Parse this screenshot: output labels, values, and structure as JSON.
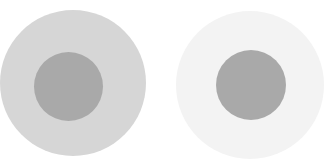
{
  "figure": {
    "left": {
      "outer_color": "#d6d6d6",
      "inner_color": "#a9a9a9"
    },
    "right": {
      "outer_color": "#f3f3f3",
      "inner_color": "#a9a9a9"
    }
  }
}
